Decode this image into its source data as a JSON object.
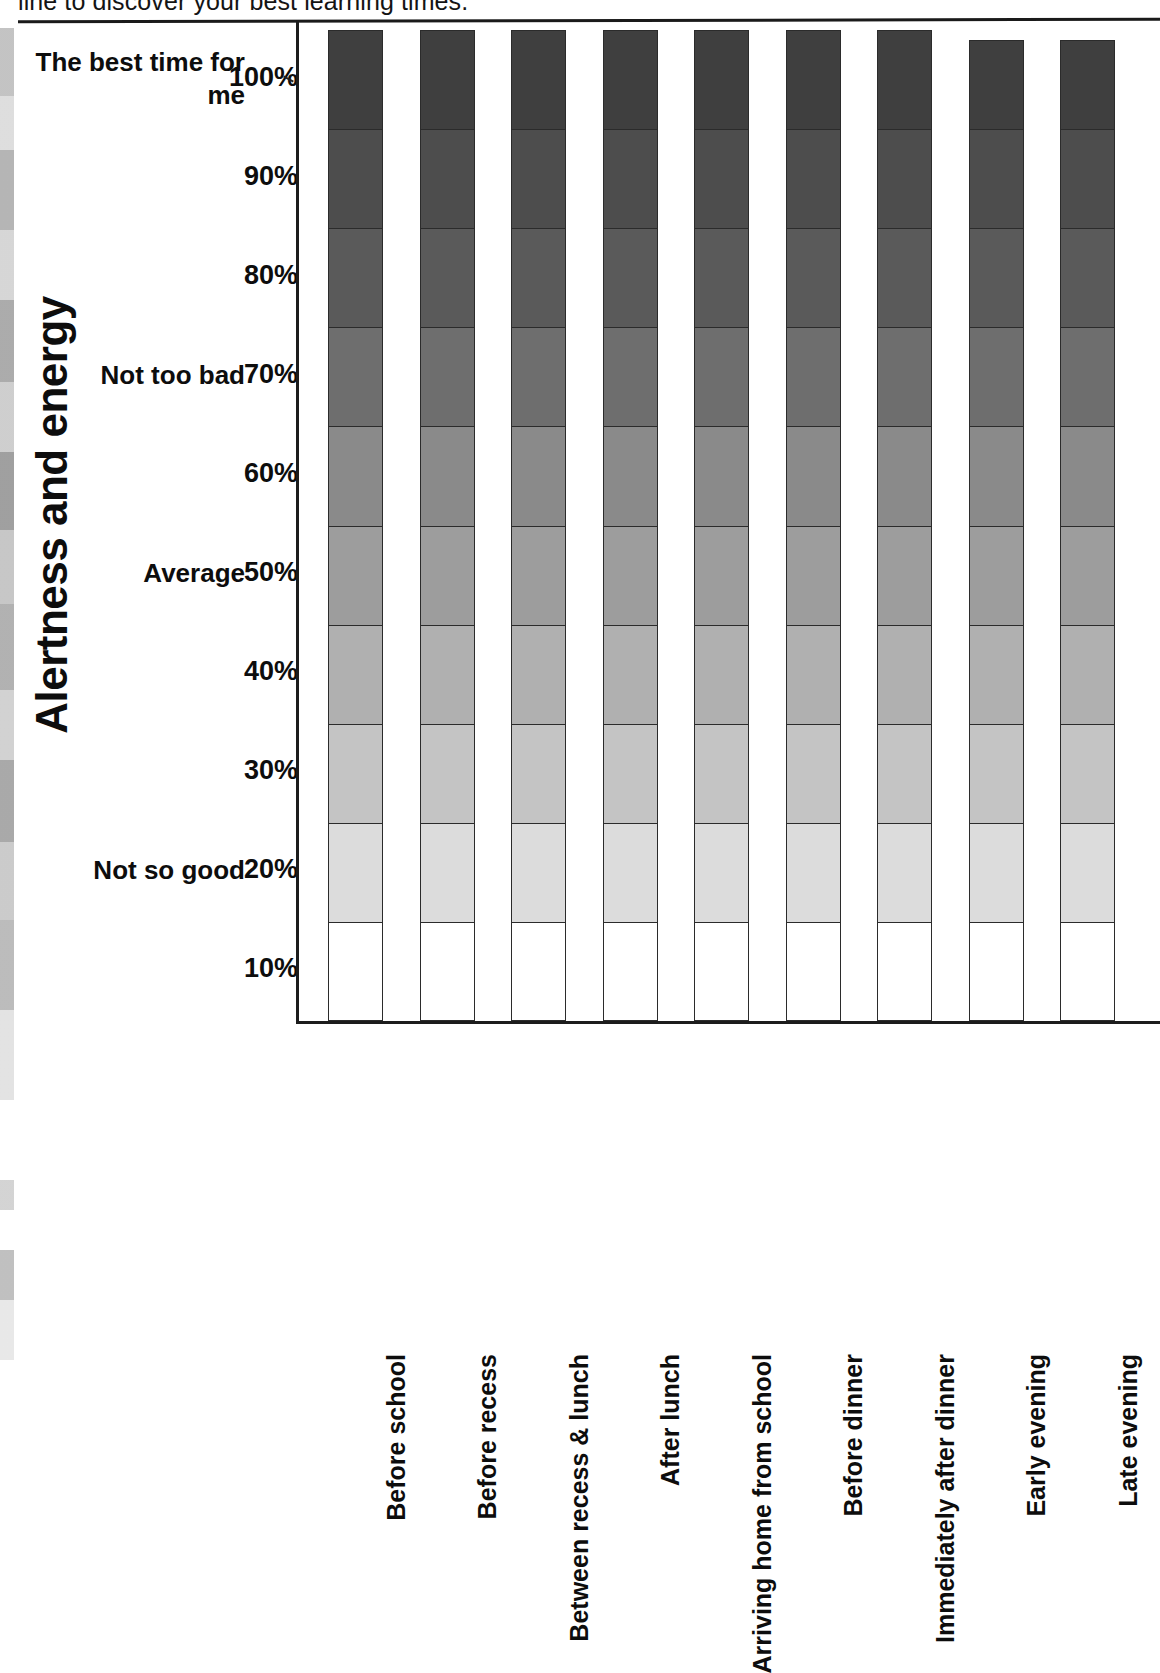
{
  "page": {
    "top_instruction": "line to discover your best learning times."
  },
  "chart_data": {
    "type": "bar",
    "title": "",
    "subtitle": "",
    "ylabel": "Alertness and energy",
    "xlabel": "",
    "ylim": [
      0,
      100
    ],
    "grid": false,
    "legend_position": "none",
    "stacked": true,
    "orientation": "vertical",
    "y_tick_labels": [
      "100%",
      "90%",
      "80%",
      "70%",
      "60%",
      "50%",
      "40%",
      "30%",
      "20%",
      "10%"
    ],
    "y_tick_values": [
      100,
      90,
      80,
      70,
      60,
      50,
      40,
      30,
      20,
      10
    ],
    "band_labels": [
      {
        "text": "The best time for me",
        "value": 100
      },
      {
        "text": "Not too bad",
        "value": 70
      },
      {
        "text": "Average",
        "value": 50
      },
      {
        "text": "Not so good",
        "value": 20
      }
    ],
    "categories": [
      "Before school",
      "Before recess",
      "Between recess & lunch",
      "After lunch",
      "Arriving home from school",
      "Before dinner",
      "Immediately after dinner",
      "Early evening",
      "Late evening"
    ],
    "segment_levels": [
      100,
      90,
      80,
      70,
      60,
      50,
      40,
      30,
      20,
      10
    ],
    "segment_colors": [
      "#3f3f3f",
      "#4d4d4d",
      "#5a5a5a",
      "#6e6e6e",
      "#8a8a8a",
      "#9d9d9d",
      "#b0b0b0",
      "#c4c4c4",
      "#dcdcdc",
      "#ffffff"
    ],
    "values": [
      100,
      100,
      100,
      100,
      100,
      100,
      100,
      99,
      99
    ],
    "series": [
      {
        "name": "100%",
        "values": [
          10,
          10,
          10,
          10,
          10,
          10,
          10,
          9,
          9
        ]
      },
      {
        "name": "90%",
        "values": [
          10,
          10,
          10,
          10,
          10,
          10,
          10,
          10,
          10
        ]
      },
      {
        "name": "80%",
        "values": [
          10,
          10,
          10,
          10,
          10,
          10,
          10,
          10,
          10
        ]
      },
      {
        "name": "70%",
        "values": [
          10,
          10,
          10,
          10,
          10,
          10,
          10,
          10,
          10
        ]
      },
      {
        "name": "60%",
        "values": [
          10,
          10,
          10,
          10,
          10,
          10,
          10,
          10,
          10
        ]
      },
      {
        "name": "50%",
        "values": [
          10,
          10,
          10,
          10,
          10,
          10,
          10,
          10,
          10
        ]
      },
      {
        "name": "40%",
        "values": [
          10,
          10,
          10,
          10,
          10,
          10,
          10,
          10,
          10
        ]
      },
      {
        "name": "30%",
        "values": [
          10,
          10,
          10,
          10,
          10,
          10,
          10,
          10,
          10
        ]
      },
      {
        "name": "20%",
        "values": [
          10,
          10,
          10,
          10,
          10,
          10,
          10,
          10,
          10
        ]
      },
      {
        "name": "10%",
        "values": [
          10,
          10,
          10,
          10,
          10,
          10,
          10,
          10,
          10
        ]
      }
    ]
  }
}
